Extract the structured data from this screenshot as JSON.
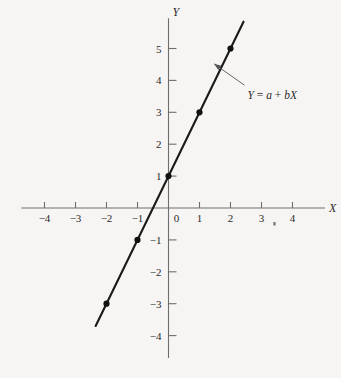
{
  "chart_data": {
    "type": "line",
    "title": "",
    "subtitle": "",
    "xlabel": "X",
    "ylabel": "Y",
    "xlim": [
      -4.75,
      5.05
    ],
    "ylim": [
      -4.7,
      5.95
    ],
    "grid": false,
    "legend_position": "none",
    "x_ticks": [
      -4,
      -3,
      -2,
      -1,
      0,
      1,
      2,
      3,
      4
    ],
    "x_tick_labels": [
      "−4",
      "−3",
      "−2",
      "−1",
      "0",
      "1",
      "2",
      "3",
      "4"
    ],
    "y_ticks": [
      -4,
      -3,
      -2,
      -1,
      1,
      2,
      3,
      4,
      5
    ],
    "y_tick_labels": [
      "−4",
      "−3",
      "−2",
      "−1",
      "1",
      "2",
      "3",
      "4",
      "5"
    ],
    "series": [
      {
        "name": "Y = a + bX",
        "intercept": 1,
        "slope": 2,
        "line_x_range": [
          -2.35,
          2.42
        ],
        "x": [
          -2,
          -1,
          0,
          1,
          2
        ],
        "values": [
          -3,
          -1,
          1,
          3,
          5
        ],
        "points": [
          {
            "x": -2,
            "y": -3
          },
          {
            "x": -1,
            "y": -1
          },
          {
            "x": 0,
            "y": 1
          },
          {
            "x": 1,
            "y": 3
          },
          {
            "x": 2,
            "y": 5
          }
        ]
      }
    ],
    "annotations": [
      {
        "name": "line-equation",
        "text_parts": [
          "Y",
          " = ",
          "a",
          " + ",
          "b",
          "X"
        ],
        "text": "Y = a + bX",
        "text_x": 2.55,
        "text_y": 3.42,
        "arrow_from_x": 2.45,
        "arrow_from_y": 3.85,
        "arrow_to_x": 1.47,
        "arrow_to_y": 4.52
      }
    ],
    "colors": {
      "background": "#f6f5f3",
      "axis": "#6e6e6e",
      "line": "#1a1a1a",
      "marker": "#111111",
      "text": "#2b2b2b",
      "annotation": "#555555"
    },
    "speck_artifact": {
      "x": 3.38,
      "y": -0.44
    }
  }
}
